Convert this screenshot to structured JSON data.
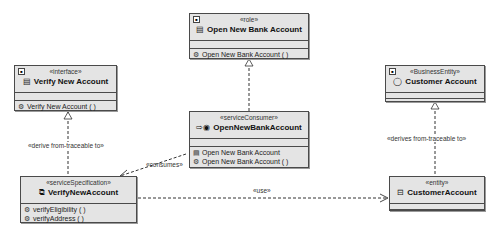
{
  "classes": {
    "role": {
      "stereotype": "«role»",
      "name": "Open New Bank Account",
      "icon": "document-icon",
      "operations": [
        {
          "icon": "gear-icon",
          "label": "Open New Bank Account ( )"
        }
      ]
    },
    "interface": {
      "stereotype": "«interface»",
      "name": "Verify New Account",
      "icon": "document-icon",
      "operations": [
        {
          "icon": "gear-icon",
          "label": "Verify New Account ( )"
        }
      ]
    },
    "business_entity": {
      "stereotype": "«BusinessEntity»",
      "name": "Customer Account",
      "icon": "entity-circle-icon",
      "operations": []
    },
    "service_consumer": {
      "stereotype": "«serviceConsumer»",
      "name": "OpenNewBankAccount",
      "icon": "consumer-arrow-icon",
      "operations": [
        {
          "icon": "document-icon",
          "label": "Open New Bank Account"
        },
        {
          "icon": "gear-icon",
          "label": "Open New Bank Account ( )"
        }
      ]
    },
    "service_specification": {
      "stereotype": "«serviceSpecification»",
      "name": "VerifyNewAccount",
      "icon": "service-spec-icon",
      "operations": [
        {
          "icon": "gear-icon",
          "label": "verifyEligibility ( )"
        },
        {
          "icon": "gear-icon",
          "label": "verifyAddress ( )"
        }
      ]
    },
    "entity": {
      "stereotype": "«entity»",
      "name": "CustomerAccount",
      "icon": "component-icon",
      "operations": []
    }
  },
  "relationships": {
    "derive_left": "«derive from-traceable to»",
    "derive_right": "«derives from-traceable to»",
    "consumes": "«consumes»",
    "use": "«use»"
  },
  "colors": {
    "box_fill": "#e4e4e4",
    "border": "#4a4a4a",
    "line": "#333333"
  }
}
